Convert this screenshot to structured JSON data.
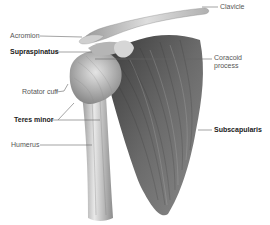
{
  "diagram": {
    "labels": [
      {
        "id": "clavicle",
        "text": "Clavicle",
        "bold": false
      },
      {
        "id": "acromion",
        "text": "Acromion",
        "bold": false
      },
      {
        "id": "supraspinatus",
        "text": "Supraspinatus",
        "bold": true
      },
      {
        "id": "coracoid",
        "text": "Coracoid\nprocess",
        "line1": "Coracoid",
        "line2": "process",
        "bold": false
      },
      {
        "id": "rotator_cuff",
        "text": "Rotator cuff",
        "bold": false
      },
      {
        "id": "teres_minor",
        "text": "Teres minor",
        "bold": true
      },
      {
        "id": "subscapularis",
        "text": "Subscapularis",
        "bold": true
      },
      {
        "id": "humerus",
        "text": "Humerus",
        "bold": false
      }
    ],
    "colors": {
      "background": "#ffffff",
      "label_text": "#555555",
      "bold_label_text": "#1a1a1a",
      "leader_line": "#666666",
      "bone_light": "#e6e6e6",
      "muscle_dark": "#4a4a4a"
    }
  }
}
